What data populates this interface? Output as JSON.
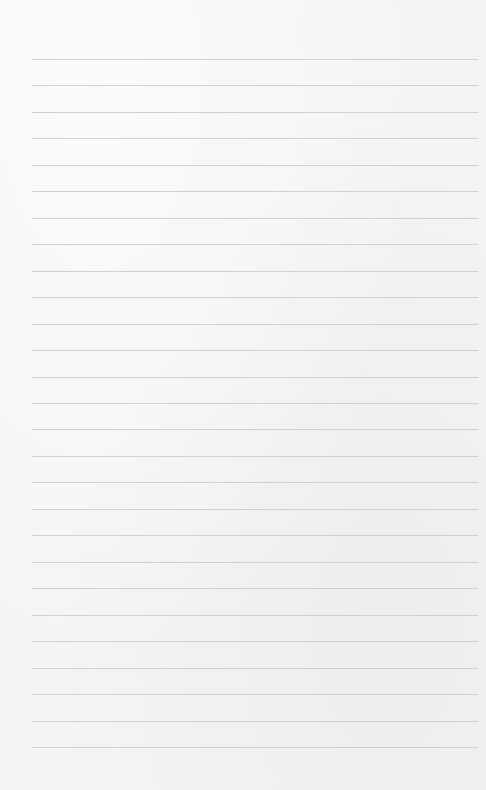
{
  "paper": {
    "type": "lined-paper",
    "background_color": "#f4f4f3",
    "line_color": "#c9c9c7",
    "line_count": 27,
    "first_line_y": 59,
    "line_spacing": 26.46,
    "line_left_x": 32,
    "line_right_x": 478
  }
}
